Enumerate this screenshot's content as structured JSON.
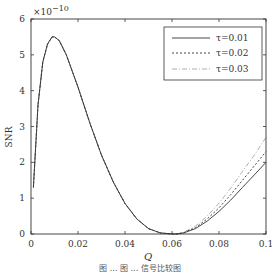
{
  "chart_data": {
    "type": "line",
    "title": "",
    "xlabel": "Q",
    "ylabel": "SNR",
    "y_multiplier": "×10⁻¹⁰",
    "xlim": [
      0,
      0.1
    ],
    "ylim": [
      0,
      6
    ],
    "xticks": [
      "0",
      "0.02",
      "0.04",
      "0.06",
      "0.08",
      "0.1"
    ],
    "yticks": [
      "0",
      "1",
      "2",
      "3",
      "4",
      "5",
      "6"
    ],
    "grid": false,
    "legend_position": "upper right",
    "series": [
      {
        "name": "τ=0.01",
        "style": "solid",
        "x": [
          0.001,
          0.003,
          0.005,
          0.007,
          0.009,
          0.01,
          0.012,
          0.015,
          0.02,
          0.025,
          0.03,
          0.035,
          0.04,
          0.045,
          0.05,
          0.055,
          0.06,
          0.062,
          0.065,
          0.07,
          0.075,
          0.08,
          0.085,
          0.09,
          0.095,
          0.1
        ],
        "y": [
          1.3,
          3.6,
          4.8,
          5.3,
          5.5,
          5.5,
          5.4,
          5.0,
          4.1,
          3.1,
          2.2,
          1.45,
          0.85,
          0.42,
          0.15,
          0.03,
          0.0,
          0.0,
          0.03,
          0.15,
          0.36,
          0.63,
          0.95,
          1.3,
          1.65,
          2.0
        ]
      },
      {
        "name": "τ=0.02",
        "style": "dashed",
        "x": [
          0.001,
          0.003,
          0.005,
          0.007,
          0.009,
          0.01,
          0.012,
          0.015,
          0.02,
          0.025,
          0.03,
          0.035,
          0.04,
          0.045,
          0.05,
          0.055,
          0.06,
          0.062,
          0.065,
          0.07,
          0.075,
          0.08,
          0.085,
          0.09,
          0.095,
          0.1
        ],
        "y": [
          1.3,
          3.6,
          4.8,
          5.3,
          5.5,
          5.5,
          5.4,
          5.0,
          4.1,
          3.1,
          2.2,
          1.45,
          0.85,
          0.42,
          0.15,
          0.03,
          0.0,
          0.0,
          0.04,
          0.18,
          0.42,
          0.73,
          1.1,
          1.5,
          1.9,
          2.3
        ]
      },
      {
        "name": "τ=0.03",
        "style": "dash-dot",
        "x": [
          0.001,
          0.003,
          0.005,
          0.007,
          0.009,
          0.01,
          0.012,
          0.015,
          0.02,
          0.025,
          0.03,
          0.035,
          0.04,
          0.045,
          0.05,
          0.055,
          0.06,
          0.062,
          0.065,
          0.07,
          0.075,
          0.08,
          0.085,
          0.09,
          0.095,
          0.1
        ],
        "y": [
          1.3,
          3.6,
          4.8,
          5.3,
          5.5,
          5.5,
          5.4,
          5.0,
          4.1,
          3.1,
          2.2,
          1.45,
          0.85,
          0.42,
          0.15,
          0.03,
          0.0,
          0.0,
          0.05,
          0.22,
          0.5,
          0.86,
          1.28,
          1.75,
          2.2,
          2.7
        ]
      }
    ]
  },
  "labels": {
    "ylabel": "SNR",
    "xlabel": "Q",
    "multiplier_base": "×10",
    "multiplier_exp": "−10",
    "legend": [
      "τ=0.01",
      "τ=0.02",
      "τ=0.03"
    ],
    "caption": "图 ... 图 ... 信号比较图"
  }
}
